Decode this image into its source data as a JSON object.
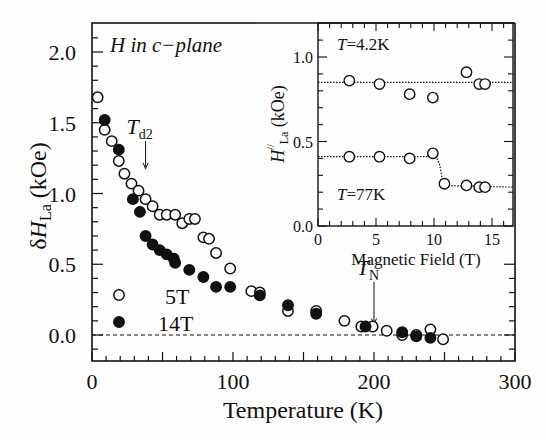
{
  "chart_data": [
    {
      "type": "scatter",
      "title": "",
      "annotation": "H in c-plane",
      "xlabel": "Temperature (K)",
      "ylabel": "δH_La (kOe)",
      "ylabel_main": "δH",
      "ylabel_sub": "La",
      "ylabel_unit": "(kOe)",
      "xlim": [
        0,
        300
      ],
      "ylim": [
        -0.18,
        2.2
      ],
      "x_ticks": [
        0,
        100,
        200,
        300
      ],
      "x_tick_labels": [
        "0",
        "100",
        "200",
        "300"
      ],
      "y_ticks": [
        0.0,
        0.5,
        1.0,
        1.5,
        2.0
      ],
      "y_tick_labels": [
        "0.0",
        "0.5",
        "1.0",
        "1.5",
        "2.0"
      ],
      "grid": false,
      "reference_line": {
        "y": 0.0,
        "style": "dashed"
      },
      "legend": {
        "position": "lower-left",
        "entries": [
          {
            "label": "5T",
            "marker": "open-circle"
          },
          {
            "label": "14T",
            "marker": "filled-circle"
          }
        ]
      },
      "annotations": [
        {
          "text": "T_d2",
          "main": "T",
          "sub": "d2",
          "x": 38,
          "arrow_to_y": 1.16
        },
        {
          "text": "T_N",
          "main": "T",
          "sub": "N",
          "x": 200,
          "arrow_to_y": 0.06
        }
      ],
      "series": [
        {
          "name": "5T",
          "marker": "open",
          "x": [
            4,
            9,
            14,
            19,
            23,
            28,
            33,
            38,
            43,
            48,
            53,
            59,
            64,
            69,
            73,
            79,
            83,
            88,
            98,
            113,
            119,
            139,
            159,
            179,
            191,
            199,
            209,
            220,
            230,
            240,
            249
          ],
          "y": [
            1.68,
            1.45,
            1.37,
            1.23,
            1.14,
            1.07,
            1.02,
            0.96,
            0.91,
            0.85,
            0.85,
            0.85,
            0.79,
            0.82,
            0.82,
            0.69,
            0.68,
            0.58,
            0.47,
            0.31,
            0.3,
            0.17,
            0.17,
            0.1,
            0.06,
            0.06,
            0.03,
            0.0,
            0.0,
            0.04,
            -0.03
          ]
        },
        {
          "name": "14T",
          "marker": "filled",
          "x": [
            9,
            19,
            29,
            34,
            38,
            43,
            48,
            53,
            58,
            59,
            69,
            79,
            88,
            98,
            119,
            139,
            159,
            194,
            220,
            230,
            240
          ],
          "y": [
            1.52,
            1.31,
            0.96,
            0.87,
            0.7,
            0.64,
            0.6,
            0.57,
            0.54,
            0.51,
            0.46,
            0.41,
            0.34,
            0.34,
            0.28,
            0.21,
            0.15,
            0.06,
            0.02,
            -0.01,
            -0.02
          ]
        }
      ]
    },
    {
      "type": "scatter",
      "title": "",
      "xlabel": "Magnetic Field (T)",
      "ylabel": "H//_La (kOe)",
      "ylabel_main": "H",
      "ylabel_sup": "//",
      "ylabel_sub": "La",
      "ylabel_unit": "(kOe)",
      "xlim": [
        0,
        16.8
      ],
      "ylim": [
        0.0,
        1.2
      ],
      "x_ticks": [
        0,
        5,
        10,
        15
      ],
      "x_tick_labels": [
        "0",
        "5",
        "10",
        "15"
      ],
      "y_ticks": [
        0.0,
        0.5,
        1.0
      ],
      "y_tick_labels": [
        "0.0",
        "0.5",
        "1.0"
      ],
      "grid": false,
      "series": [
        {
          "name": "T=4.2K",
          "label_main": "T",
          "label_rest": "=4.2K",
          "marker": "open",
          "x": [
            2.7,
            5.3,
            7.9,
            9.9,
            12.8,
            13.9,
            14.4
          ],
          "y": [
            0.86,
            0.84,
            0.78,
            0.76,
            0.91,
            0.84,
            0.84
          ],
          "fit_line": {
            "x": [
              0,
              16.8
            ],
            "y": [
              0.85,
              0.85
            ],
            "style": "dotted"
          }
        },
        {
          "name": "T=77K",
          "label_main": "T",
          "label_rest": "=77K",
          "marker": "open",
          "x": [
            2.7,
            5.3,
            7.9,
            9.9,
            10.9,
            12.8,
            13.9,
            14.4
          ],
          "y": [
            0.41,
            0.41,
            0.4,
            0.43,
            0.25,
            0.24,
            0.23,
            0.23
          ],
          "fit_line": {
            "x": [
              0,
              10.2,
              10.5,
              10.8,
              16.8
            ],
            "y": [
              0.41,
              0.41,
              0.36,
              0.24,
              0.23
            ],
            "style": "dotted"
          }
        }
      ]
    }
  ],
  "colors": {
    "ink": "#111111",
    "background": "#fdfdfd"
  }
}
